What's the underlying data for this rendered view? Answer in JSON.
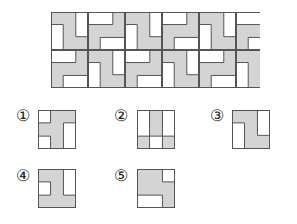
{
  "colors": {
    "fill": "#d4d4d4",
    "empty": "#ffffff",
    "line": "#555555"
  },
  "pattern": {
    "rows": 2,
    "columns_visible": 5.7,
    "tile_layout": [
      [
        "A",
        "B",
        "A",
        "B",
        "A",
        "B"
      ],
      [
        "B",
        "A",
        "B",
        "A",
        "B",
        "A"
      ]
    ]
  },
  "tiles": {
    "A": {
      "description": "gray square with white left-bottom bar and white right-top bar",
      "white_rects": [
        [
          0,
          0.33,
          0.33,
          0.67
        ],
        [
          0.67,
          0,
          0.33,
          0.65
        ]
      ],
      "lines": [
        [
          0.33,
          0.33,
          0.33,
          1
        ],
        [
          0.33,
          0.33,
          0,
          0.33
        ],
        [
          0.67,
          0,
          0.67,
          0.65
        ],
        [
          0.67,
          0.65,
          1,
          0.65
        ]
      ]
    },
    "B": {
      "description": "gray square with white top-left bar and white bottom-right bar",
      "white_rects": [
        [
          0,
          0,
          0.67,
          0.33
        ],
        [
          0.33,
          0.67,
          0.67,
          0.33
        ]
      ],
      "lines": [
        [
          0,
          0.33,
          0.67,
          0.33
        ],
        [
          0.67,
          0.33,
          0.67,
          0
        ],
        [
          0.33,
          0.67,
          1,
          0.67
        ],
        [
          0.33,
          0.67,
          0.33,
          1
        ]
      ]
    }
  },
  "options": [
    {
      "label": "①",
      "white_rects": [
        [
          0,
          0,
          0.33,
          0.33
        ],
        [
          0,
          0.67,
          0.33,
          0.33
        ],
        [
          0.67,
          0.33,
          0.33,
          0.67
        ]
      ],
      "lines": [
        [
          0.33,
          0,
          0.33,
          0.33
        ],
        [
          0,
          0.33,
          0.33,
          0.33
        ],
        [
          0,
          0.67,
          0.33,
          0.67
        ],
        [
          0.33,
          0.67,
          0.33,
          1
        ],
        [
          0.67,
          0.33,
          1,
          0.33
        ],
        [
          0.67,
          0.33,
          0.67,
          1
        ]
      ]
    },
    {
      "label": "②",
      "white_rects": [
        [
          0,
          0,
          0.33,
          0.67
        ],
        [
          0.67,
          0,
          0.33,
          0.67
        ],
        [
          0.33,
          0.67,
          0.34,
          0.33
        ]
      ],
      "lines": [
        [
          0.33,
          0,
          0.33,
          1
        ],
        [
          0.67,
          0,
          0.67,
          1
        ],
        [
          0,
          0.67,
          1,
          0.67
        ]
      ]
    },
    {
      "label": "③",
      "white_rects": [
        [
          0,
          0.33,
          0.33,
          0.67
        ],
        [
          0.67,
          0,
          0.33,
          0.65
        ]
      ],
      "lines": [
        [
          0,
          0.33,
          0.33,
          0.33
        ],
        [
          0.33,
          0.33,
          0.33,
          1
        ],
        [
          0.67,
          0,
          0.67,
          0.65
        ],
        [
          0.67,
          0.65,
          1,
          0.65
        ]
      ]
    },
    {
      "label": "④",
      "white_rects": [
        [
          0,
          0.33,
          0.33,
          0.34
        ],
        [
          0.67,
          0,
          0.33,
          0.67
        ]
      ],
      "lines": [
        [
          0,
          0.33,
          0.33,
          0.33
        ],
        [
          0.33,
          0.33,
          0.33,
          0.67
        ],
        [
          0,
          0.67,
          0.33,
          0.67
        ],
        [
          0.67,
          0,
          0.67,
          0.67
        ],
        [
          0.67,
          0.67,
          1,
          0.67
        ]
      ]
    },
    {
      "label": "⑤",
      "white_rects": [
        [
          0.67,
          0,
          0.33,
          0.33
        ],
        [
          0,
          0.67,
          0.67,
          0.33
        ]
      ],
      "lines": [
        [
          0.67,
          0,
          0.67,
          0.33
        ],
        [
          0.67,
          0.33,
          1,
          0.33
        ],
        [
          0,
          0.67,
          0.67,
          0.67
        ],
        [
          0.67,
          0.67,
          0.67,
          1
        ]
      ]
    }
  ]
}
